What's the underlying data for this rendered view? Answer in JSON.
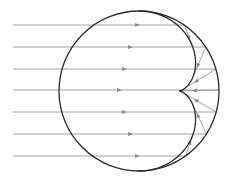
{
  "diagram": {
    "title": "",
    "circle": {
      "cx": 139,
      "cy": 91,
      "r": 80,
      "stroke": "#2a2a2a"
    },
    "caustic": {
      "type": "nephroid",
      "stroke": "#2a2a2a"
    },
    "rays": {
      "stroke": "#8a8a8a",
      "x_start": 13,
      "ys": [
        25,
        47,
        69,
        90,
        112,
        134,
        156
      ],
      "arrow_x": [
        137,
        130,
        124,
        119,
        124,
        130,
        137
      ]
    },
    "colors": {
      "background": "#ffffff",
      "ray": "#8a8a8a",
      "outline": "#2a2a2a"
    }
  }
}
